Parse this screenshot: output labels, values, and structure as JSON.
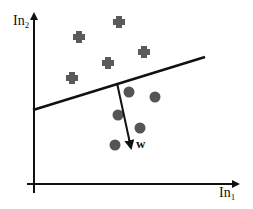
{
  "diagram": {
    "title": "",
    "axes": {
      "y_label": {
        "base": "In",
        "sub": "2"
      },
      "x_label": {
        "base": "In",
        "sub": "1"
      }
    },
    "weight_vector_label": "w",
    "colors": {
      "cross": "#5a5a5a",
      "circle": "#555555",
      "line": "#111111",
      "background": "#ffffff"
    },
    "class_a_crosses": [
      {
        "x": 119,
        "y": 22
      },
      {
        "x": 79,
        "y": 37
      },
      {
        "x": 144,
        "y": 52
      },
      {
        "x": 108,
        "y": 63
      },
      {
        "x": 72,
        "y": 78
      }
    ],
    "class_b_circles": [
      {
        "x": 129,
        "y": 92
      },
      {
        "x": 155,
        "y": 97
      },
      {
        "x": 118,
        "y": 115
      },
      {
        "x": 140,
        "y": 128
      },
      {
        "x": 115,
        "y": 145
      }
    ],
    "decision_boundary": {
      "x1": 33,
      "y1": 110,
      "x2": 205,
      "y2": 57
    },
    "weight_vector": {
      "x1": 117,
      "y1": 83,
      "x2": 131,
      "y2": 148
    }
  }
}
